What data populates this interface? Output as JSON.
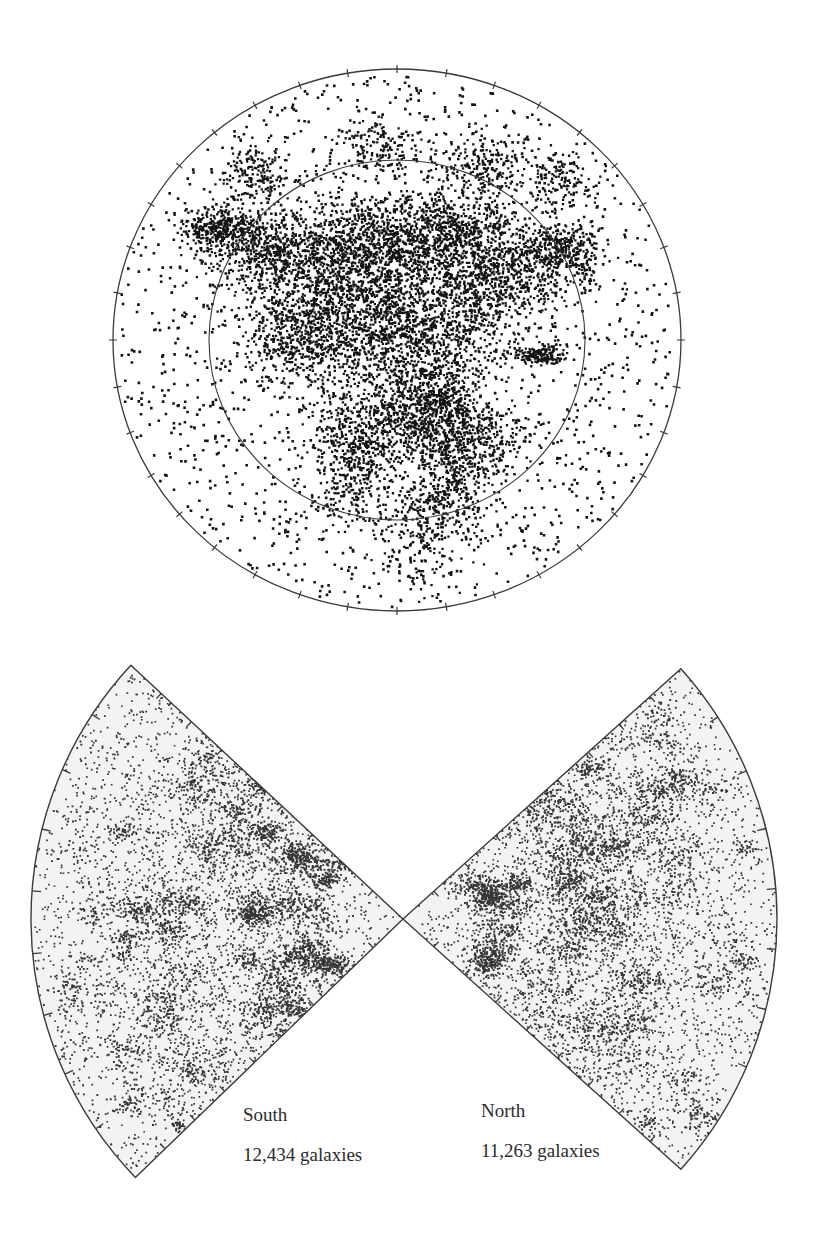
{
  "figure": {
    "width": 821,
    "height": 1239,
    "background": "#ffffff",
    "ink_color": "#141414",
    "line_color": "#3a3a3a",
    "wedge_fill": "#f3f3f3"
  },
  "sky_map": {
    "label": "Polar sky distribution of galaxies",
    "center": [
      397,
      340
    ],
    "outer_radius": [
      284,
      271
    ],
    "inner_radius": [
      188,
      180
    ],
    "tick_count": 36,
    "tick_length": 8
  },
  "wedges": [
    {
      "id": "south",
      "name": "South",
      "count_label": "12,434 galaxies",
      "galaxy_count": 12434,
      "apex": [
        403,
        919
      ],
      "radius": 372,
      "start_angle_deg": 137,
      "end_angle_deg": 224,
      "label_pos": [
        243,
        1105
      ],
      "count_pos": [
        243,
        1145
      ]
    },
    {
      "id": "north",
      "name": "North",
      "count_label": "11,263 galaxies",
      "galaxy_count": 11263,
      "apex": [
        403,
        919
      ],
      "radius": 374,
      "start_angle_deg": -42,
      "end_angle_deg": 42,
      "label_pos": [
        481,
        1101
      ],
      "count_pos": [
        481,
        1141
      ]
    }
  ],
  "chart_data": [
    {
      "type": "scatter",
      "title": "",
      "subtitle": "Sky map (polar projection) of galaxy positions",
      "xlabel": "",
      "ylabel": "",
      "grid": false,
      "legend": null,
      "layout": "circular, outer circle with 36 tick marks, inner reference circle at ~2/3 radius",
      "annotations": [],
      "notes": "Dense filamentary concentration across the upper-center and a second clump below center; sparse points toward the outer ring"
    },
    {
      "type": "scatter",
      "title": "",
      "subtitle": "Redshift-survey wedge (cone) diagrams",
      "series": [
        {
          "name": "South",
          "count": 12434,
          "label": "12,434 galaxies",
          "angular_span_deg": 87,
          "orientation": "opens left"
        },
        {
          "name": "North",
          "count": 11263,
          "label": "11,263 galaxies",
          "angular_span_deg": 84,
          "orientation": "opens right"
        }
      ],
      "xlabel": "",
      "ylabel": "",
      "grid": false,
      "legend": null,
      "annotations": [
        "South",
        "12,434 galaxies",
        "North",
        "11,263 galaxies"
      ],
      "notes": "Both wedges share an apex (observer); tick marks along the straight edges and outer arcs mark distance / angle intervals"
    }
  ],
  "render": {
    "sky_points_dense": 9000,
    "sky_points_sparse": 1800,
    "wedge_points": 6500,
    "seed": 7
  }
}
